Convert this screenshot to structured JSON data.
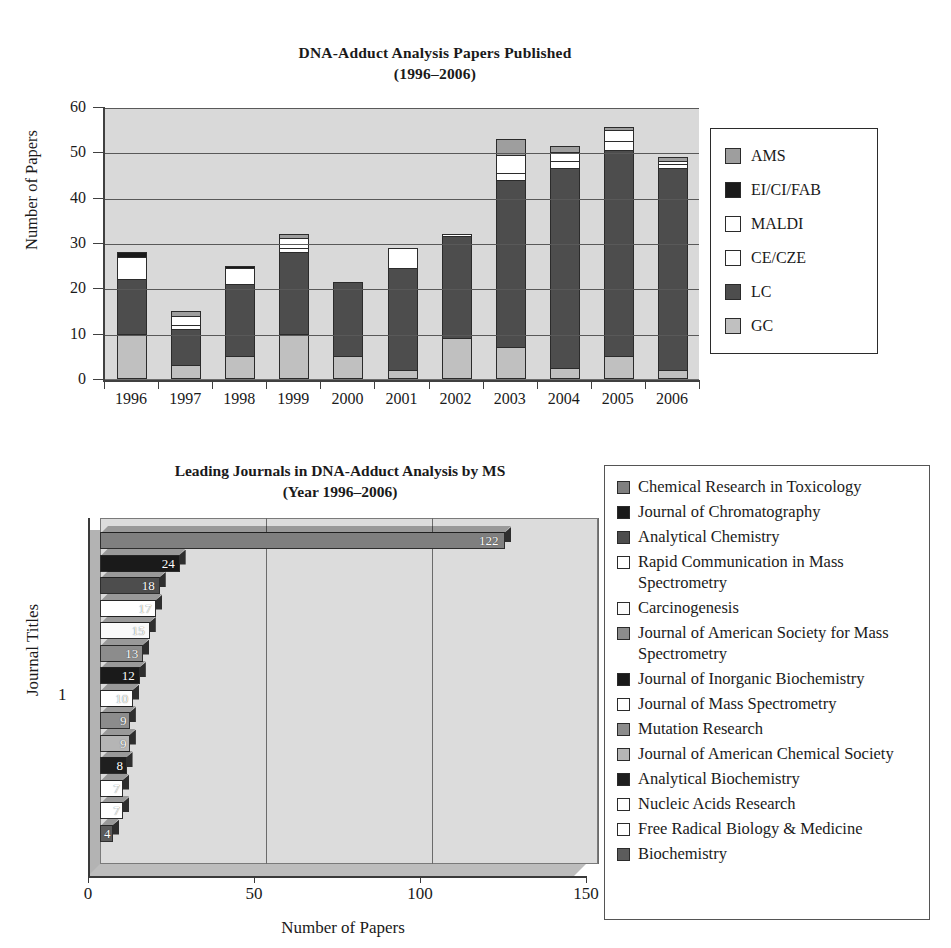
{
  "chart_data": [
    {
      "type": "bar",
      "stacked": true,
      "orientation": "vertical",
      "title": "DNA-Adduct Analysis Papers Published",
      "subtitle": "(1996–2006)",
      "xlabel": "",
      "ylabel": "Number of Papers",
      "ylim": [
        0,
        60
      ],
      "yticks": [
        0,
        10,
        20,
        30,
        40,
        50,
        60
      ],
      "grid": true,
      "legend_position": "right",
      "categories": [
        "1996",
        "1997",
        "1998",
        "1999",
        "2000",
        "2001",
        "2002",
        "2003",
        "2004",
        "2005",
        "2006"
      ],
      "series": [
        {
          "name": "GC",
          "color": "#c0c0c0",
          "values": [
            10,
            3,
            5,
            10,
            5,
            2,
            9,
            7,
            2.5,
            5,
            2
          ]
        },
        {
          "name": "LC",
          "color": "#4d4d4d",
          "values": [
            12,
            8,
            16,
            18,
            16.5,
            22.5,
            22.5,
            37,
            44,
            45.5,
            44.5
          ]
        },
        {
          "name": "CE/CZE",
          "color": "#ffffff",
          "values": [
            0,
            1,
            0,
            1,
            0,
            0,
            0,
            1.5,
            1.5,
            2,
            1
          ]
        },
        {
          "name": "MALDI",
          "color": "#ffffff",
          "values": [
            5,
            2,
            3.5,
            2,
            0,
            4.5,
            0.5,
            4,
            2,
            2.5,
            0.5
          ]
        },
        {
          "name": "EI/CI/FAB",
          "color": "#1a1a1a",
          "values": [
            1,
            0,
            0.5,
            0,
            0,
            0,
            0,
            0,
            0,
            0,
            0
          ]
        },
        {
          "name": "AMS",
          "color": "#9e9e9e",
          "values": [
            0,
            1,
            0,
            1,
            0,
            0,
            0,
            3.5,
            1.5,
            0.5,
            1
          ]
        }
      ],
      "legend_order": [
        "AMS",
        "EI/CI/FAB",
        "MALDI",
        "CE/CZE",
        "LC",
        "GC"
      ],
      "totals": [
        28,
        15,
        25,
        32,
        21.5,
        29,
        32,
        53,
        51.5,
        55.5,
        49
      ]
    },
    {
      "type": "bar",
      "orientation": "horizontal",
      "title": "Leading Journals in DNA-Adduct Analysis by MS",
      "subtitle": "(Year 1996–2006)",
      "xlabel": "Number of Papers",
      "ylabel": "Journal Titles",
      "xlim": [
        0,
        150
      ],
      "xticks": [
        0,
        50,
        100,
        150
      ],
      "ytick_labels": [
        "1"
      ],
      "grid": true,
      "legend_position": "right",
      "categories": [
        "Chemical Research in Toxicology",
        "Journal of Chromatography",
        "Analytical Chemistry",
        "Rapid Communication in Mass Spectrometry",
        "Carcinogenesis",
        "Journal of American Society for Mass Spectrometry",
        "Journal of Inorganic Biochemistry",
        "Journal of Mass Spectrometry",
        "Mutation Research",
        "Journal of American Chemical Society",
        "Analytical Biochemistry",
        "Nucleic Acids Research",
        "Free Radical Biology & Medicine",
        "Biochemistry"
      ],
      "values": [
        122,
        24,
        18,
        17,
        15,
        13,
        12,
        10,
        9,
        9,
        8,
        7,
        7,
        4
      ],
      "colors": [
        "#7f7f7f",
        "#1a1a1a",
        "#4d4d4d",
        "#ffffff",
        "#fafafa",
        "#8c8c8c",
        "#1a1a1a",
        "#ffffff",
        "#8c8c8c",
        "#b5b5b5",
        "#1f1f1f",
        "#ffffff",
        "#ffffff",
        "#5c5c5c"
      ],
      "bar_labels": [
        "122",
        "24",
        "18",
        "17",
        "15",
        "13",
        "12",
        "10",
        "9",
        "9",
        "8",
        "7",
        "7",
        "4"
      ]
    }
  ],
  "chart1": {
    "title_line1": "DNA-Adduct Analysis Papers Published",
    "title_line2": "(1996–2006)",
    "y_axis_title": "Number of Papers",
    "y_ticks": [
      "60",
      "50",
      "40",
      "30",
      "20",
      "10",
      "0"
    ],
    "x_labels": [
      "1996",
      "1997",
      "1998",
      "1999",
      "2000",
      "2001",
      "2002",
      "2003",
      "2004",
      "2005",
      "2006"
    ],
    "legend": [
      {
        "label": "AMS",
        "color": "#9e9e9e"
      },
      {
        "label": "EI/CI/FAB",
        "color": "#1a1a1a"
      },
      {
        "label": "MALDI",
        "color": "#ffffff"
      },
      {
        "label": "CE/CZE",
        "color": "#ffffff"
      },
      {
        "label": "LC",
        "color": "#4d4d4d"
      },
      {
        "label": "GC",
        "color": "#c0c0c0"
      }
    ]
  },
  "chart2": {
    "title_line1": "Leading Journals in DNA-Adduct Analysis by MS",
    "title_line2": "(Year 1996–2006)",
    "y_axis_title": "Journal Titles",
    "x_axis_title": "Number of Papers",
    "y_tick_label": "1",
    "x_labels": [
      "0",
      "50",
      "100",
      "150"
    ],
    "legend": [
      {
        "label": "Chemical Research in Toxicology",
        "color": "#7f7f7f"
      },
      {
        "label": "Journal of Chromatography",
        "color": "#1a1a1a"
      },
      {
        "label": "Analytical Chemistry",
        "color": "#4d4d4d"
      },
      {
        "label": "Rapid Communication in Mass Spectrometry",
        "color": "#ffffff"
      },
      {
        "label": "Carcinogenesis",
        "color": "#fafafa"
      },
      {
        "label": "Journal of American Society for Mass Spectrometry",
        "color": "#8c8c8c"
      },
      {
        "label": "Journal of Inorganic Biochemistry",
        "color": "#1a1a1a"
      },
      {
        "label": "Journal of Mass Spectrometry",
        "color": "#ffffff"
      },
      {
        "label": "Mutation Research",
        "color": "#8c8c8c"
      },
      {
        "label": "Journal of American Chemical Society",
        "color": "#b5b5b5"
      },
      {
        "label": "Analytical Biochemistry",
        "color": "#1f1f1f"
      },
      {
        "label": "Nucleic Acids Research",
        "color": "#ffffff"
      },
      {
        "label": "Free Radical Biology & Medicine",
        "color": "#ffffff"
      },
      {
        "label": "Biochemistry",
        "color": "#5c5c5c"
      }
    ]
  }
}
